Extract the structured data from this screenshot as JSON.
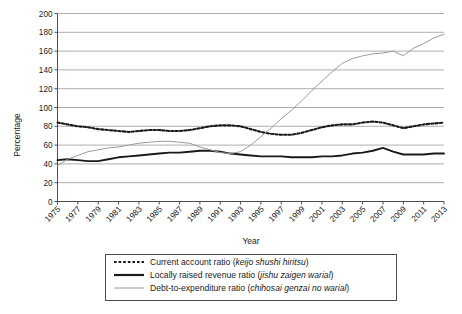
{
  "chart_data": {
    "type": "line",
    "title": "",
    "xlabel": "Year",
    "ylabel": "Percentage",
    "ylim": [
      0,
      200
    ],
    "ytick_step": 20,
    "yticks": [
      "0",
      "20",
      "40",
      "60",
      "80",
      "100",
      "120",
      "140",
      "160",
      "180",
      "200"
    ],
    "grid": true,
    "grid_axis": "y",
    "legend_position": "bottom",
    "x": [
      1975,
      1976,
      1977,
      1978,
      1979,
      1980,
      1981,
      1982,
      1983,
      1984,
      1985,
      1986,
      1987,
      1988,
      1989,
      1990,
      1991,
      1992,
      1993,
      1994,
      1995,
      1996,
      1997,
      1998,
      1999,
      2000,
      2001,
      2002,
      2003,
      2004,
      2005,
      2006,
      2007,
      2008,
      2009,
      2010,
      2011,
      2012,
      2013
    ],
    "xtick_labels": [
      "1975",
      "1977",
      "1979",
      "1981",
      "1983",
      "1985",
      "1987",
      "1989",
      "1991",
      "1993",
      "1995",
      "1997",
      "1999",
      "2001",
      "2003",
      "2005",
      "2007",
      "2009",
      "2011",
      "2013"
    ],
    "series": [
      {
        "name": "Current account ratio (keijo shushi hiritsu)",
        "name_plain": "Current account ratio",
        "name_italic": "keijo shushi hiritsu",
        "style": "dotted",
        "color": "#1a1a1a",
        "values": [
          84,
          82,
          80,
          79,
          77,
          76,
          75,
          74,
          75,
          76,
          76,
          75,
          75,
          76,
          78,
          80,
          81,
          81,
          80,
          77,
          74,
          72,
          71,
          71,
          73,
          76,
          79,
          81,
          82,
          82,
          84,
          85,
          84,
          81,
          78,
          80,
          82,
          83,
          84
        ]
      },
      {
        "name": "Locally raised revenue ratio (jishu zaigen warial)",
        "name_plain": "Locally raised revenue ratio",
        "name_italic": "jishu zaigen warial",
        "style": "solid-bold",
        "color": "#1a1a1a",
        "values": [
          44,
          45,
          44,
          43,
          43,
          45,
          47,
          48,
          49,
          50,
          51,
          52,
          52,
          53,
          54,
          54,
          53,
          51,
          50,
          49,
          48,
          48,
          48,
          47,
          47,
          47,
          48,
          48,
          49,
          51,
          52,
          54,
          57,
          53,
          50,
          50,
          50,
          51,
          51
        ]
      },
      {
        "name": "Debt-to-expenditure ratio (chihosai genzai no warial)",
        "name_plain": "Debt-to-expenditure ratio",
        "name_italic": "chihosai genzai no warial",
        "style": "solid-thin",
        "color": "#9a9a9a",
        "values": [
          38,
          45,
          49,
          53,
          55,
          57,
          58,
          60,
          62,
          63,
          64,
          64,
          63,
          62,
          58,
          55,
          52,
          51,
          53,
          60,
          69,
          78,
          88,
          97,
          107,
          118,
          128,
          138,
          147,
          152,
          155,
          157,
          158,
          160,
          155,
          163,
          168,
          174,
          178
        ]
      }
    ]
  },
  "legend": {
    "items": [
      {
        "label_plain": "Current account ratio (",
        "label_italic": "keijo shushi hiritsu",
        "label_tail": ")",
        "marker": "dotted-line-marker"
      },
      {
        "label_plain": "Locally raised revenue ratio (",
        "label_italic": "jishu zaigen warial",
        "label_tail": ")",
        "marker": "bold-line-marker"
      },
      {
        "label_plain": "Debt-to-expenditure ratio (",
        "label_italic": "chihosai genzai no warial",
        "label_tail": ")",
        "marker": "thin-gray-line-marker"
      }
    ]
  },
  "colors": {
    "grid": "#9b9b9b",
    "axis": "#4d4d4d",
    "dotted_series": "#1a1a1a",
    "bold_series": "#1a1a1a",
    "thin_series": "#9a9a9a",
    "background": "#ffffff"
  }
}
